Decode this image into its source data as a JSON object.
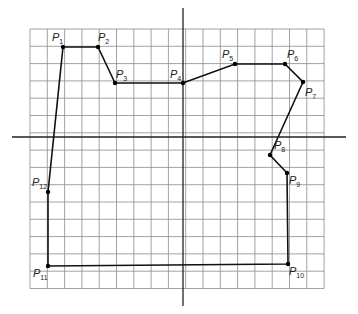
{
  "diagram": {
    "type": "polygon-on-grid",
    "grid": {
      "x0": 30,
      "y0": 29,
      "cols": 17,
      "rows": 15,
      "cell": 17.3,
      "color": "#8a8a8a"
    },
    "axes": {
      "x_axis_y": 137,
      "y_axis_x": 183,
      "x_from": 12,
      "x_to": 346,
      "y_from": 8,
      "y_to": 306,
      "color": "#222222"
    },
    "polygon_color": "#111111",
    "points": [
      {
        "name": "P",
        "sub": "1",
        "x": 63,
        "y": 47,
        "lx": 52,
        "ly": 41
      },
      {
        "name": "P",
        "sub": "2",
        "x": 98,
        "y": 47,
        "lx": 98,
        "ly": 41
      },
      {
        "name": "P",
        "sub": "3",
        "x": 115,
        "y": 83,
        "lx": 116,
        "ly": 78
      },
      {
        "name": "P",
        "sub": "4",
        "x": 183,
        "y": 83,
        "lx": 170,
        "ly": 78
      },
      {
        "name": "P",
        "sub": "5",
        "x": 235,
        "y": 64,
        "lx": 222,
        "ly": 58
      },
      {
        "name": "P",
        "sub": "6",
        "x": 285,
        "y": 64,
        "lx": 287,
        "ly": 58
      },
      {
        "name": "P",
        "sub": "7",
        "x": 303,
        "y": 82,
        "lx": 305,
        "ly": 96
      },
      {
        "name": "P",
        "sub": "8",
        "x": 270,
        "y": 155,
        "lx": 274,
        "ly": 149
      },
      {
        "name": "P",
        "sub": "9",
        "x": 287,
        "y": 173,
        "lx": 289,
        "ly": 184
      },
      {
        "name": "P",
        "sub": "10",
        "x": 288,
        "y": 264,
        "lx": 289,
        "ly": 275
      },
      {
        "name": "P",
        "sub": "11",
        "x": 48,
        "y": 266,
        "lx": 33,
        "ly": 277
      },
      {
        "name": "P",
        "sub": "12",
        "x": 48,
        "y": 192,
        "lx": 32,
        "ly": 186
      }
    ]
  }
}
